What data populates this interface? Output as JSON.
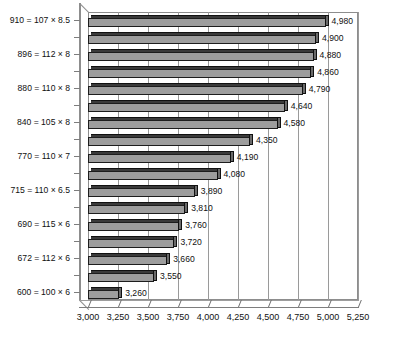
{
  "chart_data": {
    "type": "bar",
    "orientation": "horizontal",
    "title": "",
    "subtitle": "",
    "xlabel": "",
    "ylabel": "",
    "xlim": [
      3000,
      5250
    ],
    "xticks": [
      "3,000",
      "3,250",
      "3,500",
      "3,750",
      "4,000",
      "4,250",
      "4,500",
      "4,750",
      "5,000",
      "5,250"
    ],
    "xtick_values": [
      3000,
      3250,
      3500,
      3750,
      4000,
      4250,
      4500,
      4750,
      5000,
      5250
    ],
    "grid": true,
    "legend": "none",
    "style": "3d-horizontal-bars",
    "categories": [
      "910 = 107 × 8.5",
      "",
      "896 = 112 × 8",
      "",
      "880 = 110 × 8",
      "",
      "840 = 105 × 8",
      "",
      "770 = 110 × 7",
      "",
      "715 = 110 × 6.5",
      "",
      "690 = 115 × 6",
      "",
      "672 = 112 × 6",
      "",
      "600 = 100 × 6"
    ],
    "values": [
      4980,
      4900,
      4880,
      4860,
      4790,
      4640,
      4580,
      4350,
      4190,
      4080,
      3890,
      3810,
      3760,
      3720,
      3660,
      3550,
      3260
    ],
    "data_labels": [
      "4,980",
      "4,900",
      "4,880",
      "4,860",
      "4,790",
      "4,640",
      "4,580",
      "4,350",
      "4,190",
      "4,080",
      "3,890",
      "3,810",
      "3,760",
      "3,720",
      "3,660",
      "3,550",
      "3,260"
    ],
    "bar_color": "#9d9d9d",
    "bar_top_color": "#3a3a3a",
    "bar_outline_color": "#1d1d1d",
    "grid_color": "#9a9a9a",
    "background": "#ffffff"
  },
  "axis_labels": {
    "y_categories": [
      "910 = 107 × 8.5",
      "896 = 112 × 8",
      "880 = 110 × 8",
      "840 = 105 × 8",
      "770 = 110 × 7",
      "715 = 110 × 6.5",
      "690 = 115 × 6",
      "672 = 112 × 6",
      "600 = 100 × 6"
    ]
  }
}
